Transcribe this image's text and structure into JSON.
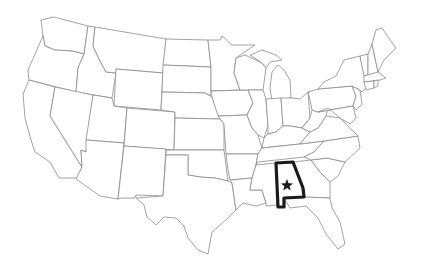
{
  "map": {
    "title": "United States map with Alabama highlighted",
    "highlighted_state": "Alabama",
    "capital_marker": "star-icon",
    "colors": {
      "background": "#ffffff",
      "state_border": "#8a8a8a",
      "highlight_border": "#1a1a1a",
      "marker": "#1a1a1a"
    }
  }
}
